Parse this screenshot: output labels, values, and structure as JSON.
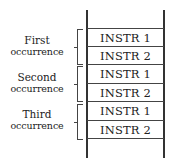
{
  "diagram": {
    "groups": [
      {
        "label_line1": "First",
        "label_line2": "occurrence",
        "instructions": [
          "INSTR 1",
          "INSTR 2"
        ]
      },
      {
        "label_line1": "Second",
        "label_line2": "occurrence",
        "instructions": [
          "INSTR 1",
          "INSTR 2"
        ]
      },
      {
        "label_line1": "Third",
        "label_line2": "occurrence",
        "instructions": [
          "INSTR 1",
          "INSTR 2"
        ]
      }
    ]
  }
}
